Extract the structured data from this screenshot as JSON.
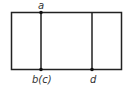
{
  "diagram": {
    "type": "rectangle-divided",
    "stroke_color": "#222222",
    "background": "#ffffff",
    "labels": {
      "top_point": "a",
      "bottom_left_point": "b(c)",
      "bottom_right_point": "d"
    },
    "points": [
      {
        "label": "a",
        "position": "top edge, first divider"
      },
      {
        "label": "b(c)",
        "position": "bottom edge, first divider"
      },
      {
        "label": "d",
        "position": "bottom edge, second divider"
      }
    ]
  }
}
